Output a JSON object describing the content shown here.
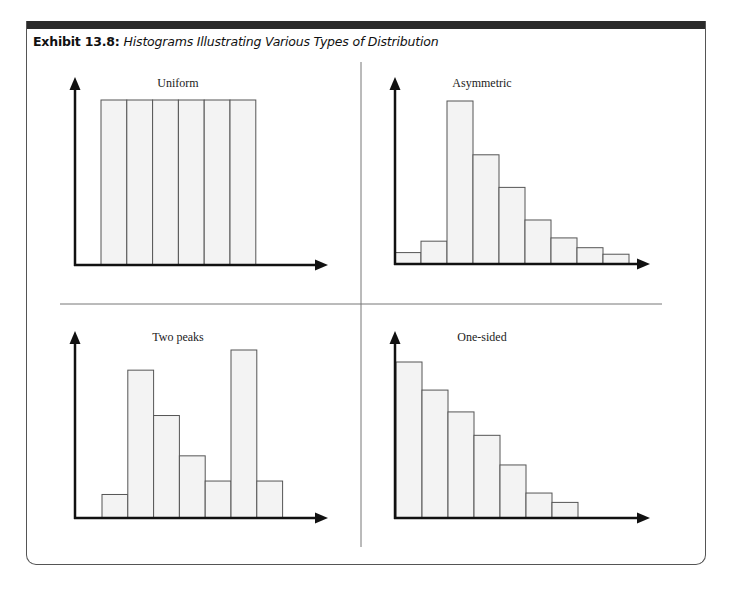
{
  "exhibit": {
    "label": "Exhibit 13.8:",
    "title": "Histograms Illustrating Various Types of Distribution"
  },
  "colors": {
    "bar_fill": "#f3f3f3",
    "bar_stroke": "#555555",
    "axis": "#111111",
    "header_bar": "#2a2a2a"
  },
  "chart_data": [
    {
      "type": "bar",
      "title": "Uniform",
      "xlabel": "",
      "ylabel": "",
      "categories": [
        "1",
        "2",
        "3",
        "4",
        "5",
        "6"
      ],
      "values": [
        100,
        100,
        100,
        100,
        100,
        100
      ],
      "ylim": [
        0,
        115
      ],
      "grid": false,
      "legend": null
    },
    {
      "type": "bar",
      "title": "Asymmetric",
      "xlabel": "",
      "ylabel": "",
      "categories": [
        "1",
        "2",
        "3",
        "4",
        "5",
        "6",
        "7",
        "8",
        "9"
      ],
      "values": [
        7,
        14,
        100,
        67,
        47,
        27,
        16,
        10,
        6
      ],
      "ylim": [
        0,
        115
      ],
      "grid": false,
      "legend": null
    },
    {
      "type": "bar",
      "title": "Two peaks",
      "xlabel": "",
      "ylabel": "",
      "categories": [
        "1",
        "2",
        "3",
        "4",
        "5",
        "6",
        "7"
      ],
      "values": [
        14,
        88,
        61,
        37,
        22,
        100,
        22
      ],
      "ylim": [
        0,
        115
      ],
      "grid": false,
      "legend": null
    },
    {
      "type": "bar",
      "title": "One-sided",
      "xlabel": "",
      "ylabel": "",
      "categories": [
        "1",
        "2",
        "3",
        "4",
        "5",
        "6",
        "7"
      ],
      "values": [
        100,
        82,
        68,
        53,
        34,
        16,
        10
      ],
      "ylim": [
        0,
        115
      ],
      "grid": false,
      "legend": null
    }
  ],
  "panels": [
    {
      "title": "Uniform",
      "origin": [
        75,
        265
      ],
      "bar_start": 101,
      "bar_width": 25.8,
      "unit_px": 1.65,
      "x_end": 328,
      "y_top": 77
    },
    {
      "title": "Asymmetric",
      "origin": [
        395,
        264
      ],
      "bar_start": 395,
      "bar_width": 26,
      "unit_px": 1.63,
      "x_end": 650,
      "y_top": 77
    },
    {
      "title": "Two peaks",
      "origin": [
        75,
        518
      ],
      "bar_start": 102,
      "bar_width": 25.8,
      "unit_px": 1.68,
      "x_end": 328,
      "y_top": 331
    },
    {
      "title": "One-sided",
      "origin": [
        395,
        518
      ],
      "bar_start": 396,
      "bar_width": 26,
      "unit_px": 1.56,
      "x_end": 650,
      "y_top": 331
    }
  ]
}
